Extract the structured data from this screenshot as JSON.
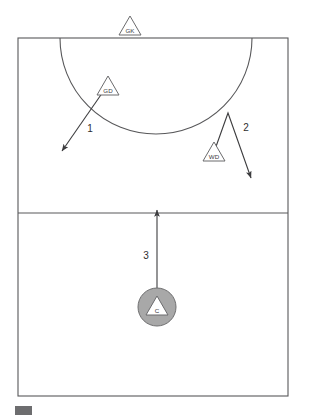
{
  "diagram": {
    "type": "netball-court-tactical-diagram",
    "title": "",
    "canvas": {
      "width": 310,
      "height": 416
    },
    "colors": {
      "court_line": "#58585a",
      "arrow": "#3d3d3f",
      "player_fill": "#ffffff",
      "player_stroke": "#6b6b6d",
      "ball_carrier_fill": "#a8a8a8",
      "legend_swatch": "#6d6d6f",
      "background": "#ffffff"
    },
    "court": {
      "outline": {
        "x": 18,
        "y": 38,
        "width": 270,
        "height": 358
      },
      "third_line_y": 213,
      "goal_circle": {
        "center_x": 156,
        "center_y": 38,
        "radius": 96
      }
    },
    "players": [
      {
        "id": "gk",
        "label": "GK",
        "position_name": "Goal Keeper",
        "x": 130,
        "y": 27,
        "size": 22,
        "marker": "triangle",
        "has_ball": false
      },
      {
        "id": "gd",
        "label": "GD",
        "position_name": "Goal Defence",
        "x": 108,
        "y": 87,
        "size": 22,
        "marker": "triangle",
        "has_ball": false
      },
      {
        "id": "wd",
        "label": "WD",
        "position_name": "Wing Defence",
        "x": 214,
        "y": 153,
        "size": 22,
        "marker": "triangle",
        "has_ball": false
      },
      {
        "id": "c",
        "label": "C",
        "position_name": "Centre",
        "x": 157,
        "y": 307,
        "size": 22,
        "marker": "triangle-in-circle",
        "circle_radius": 19,
        "has_ball": true
      }
    ],
    "movements": [
      {
        "id": "move-1",
        "number": "1",
        "player": "gd",
        "label_x": 90,
        "label_y": 132,
        "path": "M 105 89 L 62 151",
        "arrowhead_at": {
          "x": 62,
          "y": 151
        },
        "description": "Goal Defence drives down and left"
      },
      {
        "id": "move-2",
        "number": "2",
        "player": "wd",
        "label_x": 246,
        "label_y": 131,
        "path": "M 213 155 L 228 113 L 251 178",
        "arrowhead_at": {
          "x": 251,
          "y": 178
        },
        "description": "Wing Defence cuts up then drives down and right"
      },
      {
        "id": "move-3",
        "number": "3",
        "player": "c",
        "label_x": 146,
        "label_y": 259,
        "path": "M 157 288 L 157 210",
        "arrowhead_at": {
          "x": 157,
          "y": 210
        },
        "description": "Centre drives straight up through the third line"
      }
    ],
    "legend": {
      "swatch": {
        "x": 15,
        "y": 406,
        "width": 17,
        "height": 9
      },
      "text": ""
    }
  }
}
